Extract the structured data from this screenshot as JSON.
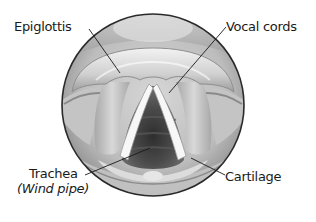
{
  "diagram": {
    "type": "anatomical-illustration",
    "colors": {
      "background": "#ffffff",
      "text": "#1a1a1a",
      "leader_line": "#1a1a1a",
      "circle_border": "#2a2a2a",
      "tissue_light": "#e8e8e8",
      "tissue_mid": "#b8b8b8",
      "tissue_dark": "#7a7a7a",
      "airway_dark": "#3a3a3a"
    },
    "labels": [
      {
        "id": "epiglottis",
        "text": "Epiglottis"
      },
      {
        "id": "vocal-cords",
        "text": "Vocal cords"
      },
      {
        "id": "trachea",
        "text": "Trachea",
        "subtext": "(Wind pipe)"
      },
      {
        "id": "cartilage",
        "text": "Cartilage"
      }
    ]
  }
}
